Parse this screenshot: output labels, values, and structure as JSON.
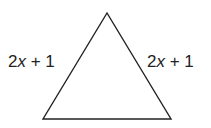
{
  "diagram": {
    "shape": "isosceles triangle",
    "vertices": {
      "apex": [
        107,
        13
      ],
      "bottom_left": [
        43,
        119
      ],
      "bottom_right": [
        171,
        119
      ]
    },
    "stroke_color": "#222222",
    "labels": {
      "left_side": {
        "coef": "2",
        "var": "x",
        "rest": " + 1"
      },
      "right_side": {
        "coef": "2",
        "var": "x",
        "rest": " + 1"
      }
    }
  }
}
